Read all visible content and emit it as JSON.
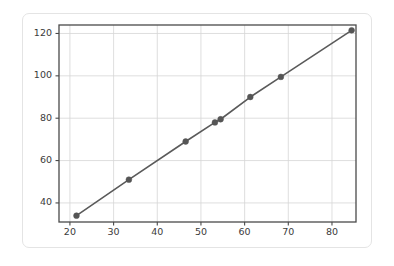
{
  "card": {
    "background_color": "#ffffff",
    "border_color": "#e4e4e4"
  },
  "chart_data": {
    "type": "line",
    "title": "",
    "subtitle": "",
    "xlabel": "",
    "ylabel": "",
    "x": [
      21.5,
      33.5,
      46.5,
      53.2,
      54.5,
      61.3,
      68.3,
      84.5
    ],
    "values": [
      34,
      51,
      69,
      78,
      79.5,
      90,
      99.5,
      121.5
    ],
    "series": [
      {
        "name": "",
        "x": [
          21.5,
          33.5,
          46.5,
          53.2,
          54.5,
          61.3,
          68.3,
          84.5
        ],
        "values": [
          34,
          51,
          69,
          78,
          79.5,
          90,
          99.5,
          121.5
        ]
      }
    ],
    "xlim": [
      17.5,
      85.5
    ],
    "ylim": [
      31,
      124
    ],
    "xticks": [
      20,
      30,
      40,
      50,
      60,
      70,
      80
    ],
    "yticks": [
      40,
      60,
      80,
      100,
      120
    ],
    "xtick_labels": [
      "20",
      "30",
      "40",
      "50",
      "60",
      "70",
      "80"
    ],
    "ytick_labels": [
      "40",
      "60",
      "80",
      "100",
      "120"
    ],
    "grid": true,
    "legend": false,
    "legend_position": "none",
    "annotations": [],
    "line_color": "#5a5a5a",
    "marker_color": "#555555",
    "marker": "circle",
    "grid_color": "#d5d5d5",
    "axis_color": "#4a4a4a",
    "plot_background_color": "#ffffff"
  }
}
